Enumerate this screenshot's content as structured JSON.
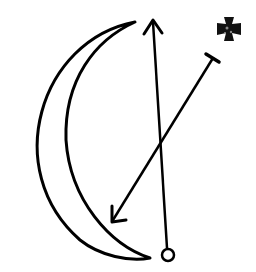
{
  "diagram": {
    "stroke_color": "#000000",
    "background": "#ffffff",
    "elements": [
      {
        "name": "crescent-moon",
        "type": "crescent"
      },
      {
        "name": "vertical-arrow",
        "type": "arrow",
        "from": [
          168,
          255
        ],
        "to": [
          153,
          20
        ],
        "tail": "open-circle"
      },
      {
        "name": "diagonal-arrow",
        "type": "arrow",
        "from": [
          213,
          56
        ],
        "to": [
          112,
          222
        ],
        "tail": "t-bar"
      },
      {
        "name": "cross-symbol",
        "type": "icon",
        "position": [
          229,
          29
        ]
      }
    ]
  }
}
